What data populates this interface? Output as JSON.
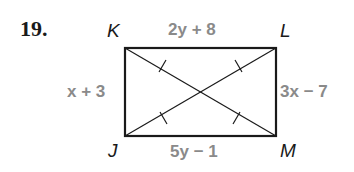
{
  "problem": {
    "number": "19."
  },
  "vertices": {
    "K": "K",
    "L": "L",
    "M": "M",
    "J": "J"
  },
  "sides": {
    "top_KL": "2y + 8",
    "left_KJ": "x + 3",
    "right_LM": "3x − 7",
    "bottom_JM": "5y − 1"
  },
  "colors": {
    "lines": "#1a1a1a",
    "expressions": "#8a8a8a"
  }
}
